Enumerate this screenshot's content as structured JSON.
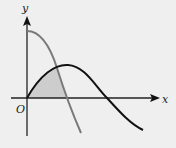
{
  "figure": {
    "type": "function-graph",
    "axes": {
      "x_label": "x",
      "y_label": "y",
      "origin_label": "O"
    },
    "curves": [
      {
        "name": "decreasing-curve",
        "color": "#7a7a7a",
        "description": "starts on y-axis high, decreases crossing x-axis"
      },
      {
        "name": "sine-like-curve",
        "color": "#111111",
        "description": "starts at origin, rises to a peak, decreases crossing x-axis"
      }
    ],
    "shaded_region": {
      "color": "#cfcfcf",
      "description": "region bounded by both curves and the x-axis near origin"
    },
    "colors": {
      "background": "#efefef",
      "axis": "#222222"
    }
  }
}
